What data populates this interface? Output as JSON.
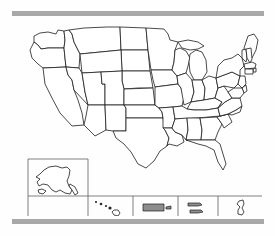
{
  "page": {
    "background_color": "#fefefe"
  },
  "decor": {
    "rail_color": "#a8a8a8",
    "top_rail_label": "top-divider-bar",
    "bottom_rail_label": "bottom-divider-bar"
  },
  "map": {
    "name": "united-states-map",
    "outline_color": "#1c1c1c",
    "fill_color": "#ffffff",
    "labels_visible": false,
    "projection_note": "contiguous-48-with-insets",
    "contiguous_state_count": 48,
    "states": [
      "Washington",
      "Oregon",
      "California",
      "Nevada",
      "Idaho",
      "Montana",
      "Wyoming",
      "Utah",
      "Arizona",
      "Colorado",
      "New Mexico",
      "North Dakota",
      "South Dakota",
      "Nebraska",
      "Kansas",
      "Oklahoma",
      "Texas",
      "Minnesota",
      "Iowa",
      "Missouri",
      "Arkansas",
      "Louisiana",
      "Wisconsin",
      "Illinois",
      "Michigan",
      "Indiana",
      "Ohio",
      "Kentucky",
      "Tennessee",
      "Mississippi",
      "Alabama",
      "Georgia",
      "Florida",
      "South Carolina",
      "North Carolina",
      "Virginia",
      "West Virginia",
      "Pennsylvania",
      "New York",
      "Maine",
      "Vermont",
      "New Hampshire",
      "Massachusetts",
      "Rhode Island",
      "Connecticut",
      "New Jersey",
      "Delaware",
      "Maryland"
    ]
  },
  "insets": [
    {
      "id": "alaska",
      "name": "Alaska",
      "fill": "#ffffff",
      "highlighted": false
    },
    {
      "id": "hawaii",
      "name": "Hawaii",
      "fill": "#2a2a2a",
      "highlighted": false
    },
    {
      "id": "puerto-rico",
      "name": "Puerto Rico",
      "fill": "#8d8d8d",
      "highlighted": true
    },
    {
      "id": "virgin-islands",
      "name": "U.S. Virgin Islands",
      "fill": "#8d8d8d",
      "highlighted": true
    },
    {
      "id": "guam",
      "name": "Guam",
      "fill": "#ffffff",
      "highlighted": false
    }
  ]
}
